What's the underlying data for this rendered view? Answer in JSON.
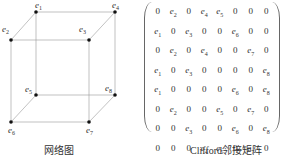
{
  "left_figure": {
    "caption": "网络图",
    "nodes": [
      {
        "id": "e1",
        "label": "e",
        "sub": "1",
        "x": 36,
        "y": 12
      },
      {
        "id": "e2",
        "label": "e",
        "sub": "2",
        "x": 11,
        "y": 40
      },
      {
        "id": "e3",
        "label": "e",
        "sub": "3",
        "x": 89,
        "y": 40
      },
      {
        "id": "e4",
        "label": "e",
        "sub": "4",
        "x": 115,
        "y": 12
      },
      {
        "id": "e5",
        "label": "e",
        "sub": "5",
        "x": 36,
        "y": 95
      },
      {
        "id": "e6",
        "label": "e",
        "sub": "6",
        "x": 11,
        "y": 122
      },
      {
        "id": "e7",
        "label": "e",
        "sub": "7",
        "x": 89,
        "y": 122
      },
      {
        "id": "e8",
        "label": "e",
        "sub": "8",
        "x": 115,
        "y": 95
      }
    ],
    "edges": [
      [
        "e1",
        "e2"
      ],
      [
        "e1",
        "e4"
      ],
      [
        "e1",
        "e5"
      ],
      [
        "e2",
        "e3"
      ],
      [
        "e2",
        "e6"
      ],
      [
        "e3",
        "e4"
      ],
      [
        "e3",
        "e7"
      ],
      [
        "e4",
        "e8"
      ],
      [
        "e5",
        "e6"
      ],
      [
        "e5",
        "e8"
      ],
      [
        "e6",
        "e7"
      ],
      [
        "e7",
        "e8"
      ]
    ]
  },
  "right_figure": {
    "caption": "Clifford邻接矩阵",
    "matrix": [
      [
        "0",
        "e2",
        "0",
        "e4",
        "e5",
        "0",
        "0",
        "0"
      ],
      [
        "e1",
        "0",
        "e3",
        "0",
        "0",
        "e6",
        "0",
        "0"
      ],
      [
        "0",
        "e2",
        "0",
        "e4",
        "0",
        "0",
        "e7",
        "0"
      ],
      [
        "e1",
        "0",
        "e3",
        "0",
        "0",
        "0",
        "0",
        "e8"
      ],
      [
        "e1",
        "0",
        "0",
        "0",
        "0",
        "e6",
        "0",
        "e8"
      ],
      [
        "0",
        "e2",
        "0",
        "0",
        "e5",
        "0",
        "e7",
        "0"
      ],
      [
        "0",
        "0",
        "e3",
        "0",
        "0",
        "e6",
        "0",
        "e8"
      ],
      [
        "0",
        "0",
        "0",
        "e4",
        "e5",
        "0",
        "e7",
        "0"
      ]
    ]
  }
}
